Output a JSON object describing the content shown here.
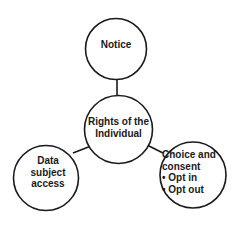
{
  "diagram": {
    "type": "hub-and-spoke",
    "colors": {
      "background": "#ffffff",
      "stroke": "#1a1a1a",
      "fill": "#ffffff",
      "text": "#1a1a1a"
    },
    "center_node": {
      "id": "rights",
      "lines": [
        "Rights of the",
        "Individual"
      ]
    },
    "nodes": [
      {
        "id": "notice",
        "position": "top",
        "lines": [
          "Notice"
        ]
      },
      {
        "id": "data-subject-access",
        "position": "bottom-left",
        "lines": [
          "Data",
          "subject",
          "access"
        ]
      },
      {
        "id": "choice-and-consent",
        "position": "bottom-right",
        "lines": [
          "Choice and",
          "consent",
          "• Opt in",
          "• Opt out"
        ]
      }
    ],
    "edges": [
      {
        "from": "rights",
        "to": "notice"
      },
      {
        "from": "rights",
        "to": "data-subject-access"
      },
      {
        "from": "rights",
        "to": "choice-and-consent"
      }
    ]
  }
}
